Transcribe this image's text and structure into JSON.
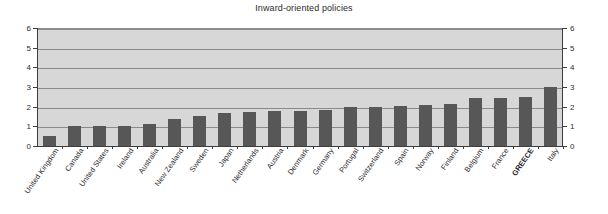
{
  "chart_data": {
    "type": "bar",
    "title": "Inward-oriented policies",
    "xlabel": "",
    "ylabel": "",
    "ylim": [
      0,
      6
    ],
    "yticks": [
      0,
      1,
      2,
      3,
      4,
      5,
      6
    ],
    "ytick_labels": [
      "0",
      "1",
      "2",
      "3",
      "4",
      "5",
      "6"
    ],
    "grid": true,
    "grid_axis": "y",
    "legend": false,
    "dual_y_axis": true,
    "highlight_category": "GREECE",
    "bar_color": "#575757",
    "plot_background": "#d7d7d7",
    "categories": [
      "United Kingdom",
      "Canada",
      "United States",
      "Ireland",
      "Australia",
      "New Zealand",
      "Sweden",
      "Japan",
      "Netherlands",
      "Austria",
      "Denmark",
      "Germany",
      "Portugal",
      "Switzerland",
      "Spain",
      "Norway",
      "Finland",
      "Belgium",
      "France",
      "GREECE",
      "Italy"
    ],
    "values": [
      0.5,
      1.0,
      1.0,
      1.0,
      1.1,
      1.35,
      1.55,
      1.7,
      1.75,
      1.8,
      1.8,
      1.85,
      2.0,
      2.0,
      2.05,
      2.1,
      2.15,
      2.45,
      2.45,
      2.5,
      3.0
    ]
  },
  "axes": {
    "left_ticks": [
      "6",
      "5",
      "4",
      "3",
      "2",
      "1",
      "0"
    ],
    "right_ticks": [
      "6",
      "5",
      "4",
      "3",
      "2",
      "1",
      "0"
    ]
  }
}
